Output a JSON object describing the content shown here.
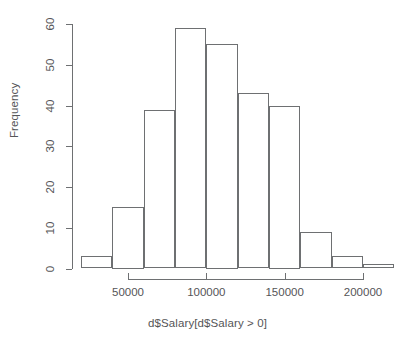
{
  "chart_data": {
    "type": "bar",
    "title": "",
    "subtitle": "",
    "xlabel": "d$Salary[d$Salary > 0]",
    "ylabel": "Frequency",
    "grid": false,
    "legend": null,
    "bin_width": 20000,
    "bin_edges": [
      20000,
      40000,
      60000,
      80000,
      100000,
      120000,
      140000,
      160000,
      180000,
      200000,
      220000
    ],
    "categories": [
      "20000-40000",
      "40000-60000",
      "60000-80000",
      "80000-100000",
      "100000-120000",
      "120000-140000",
      "140000-160000",
      "160000-180000",
      "180000-200000",
      "200000-220000"
    ],
    "values": [
      3,
      15,
      39,
      59,
      55,
      43,
      40,
      9,
      3,
      1
    ],
    "xlim": [
      20000,
      220000
    ],
    "ylim": [
      0,
      60
    ],
    "ytick_values": [
      0,
      10,
      20,
      30,
      40,
      50,
      60
    ],
    "ytick_labels": [
      "0",
      "10",
      "20",
      "30",
      "40",
      "50",
      "60"
    ],
    "xtick_values": [
      50000,
      100000,
      150000,
      200000
    ],
    "xtick_labels": [
      "50000",
      "100000",
      "150000",
      "200000"
    ],
    "xaxis_range_drawn": [
      50000,
      200000
    ],
    "colors": {
      "bar_border": "#6e7072",
      "bar_fill": "transparent",
      "axis": "#6e7072",
      "text": "#555557",
      "background": "#ffffff"
    }
  }
}
